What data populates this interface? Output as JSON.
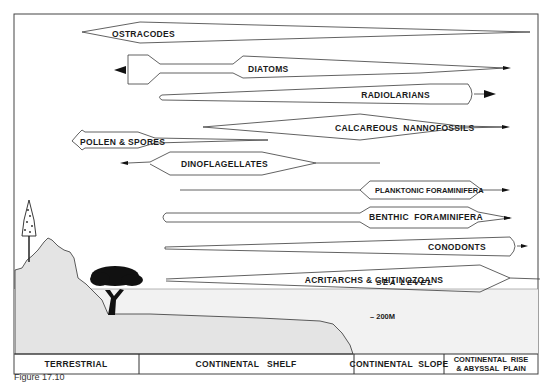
{
  "figure": {
    "caption": "Figure 17.10",
    "sea_level_label": "SEA LEVEL",
    "depth_label": "– 200M",
    "colors": {
      "line": "#3a3a3a",
      "fill_ground": "#e4e4e4",
      "fill_water": "#f2f2f2",
      "tree": "#111111"
    }
  },
  "zones": [
    {
      "label": "TERRESTRIAL"
    },
    {
      "label": "CONTINENTAL   SHELF"
    },
    {
      "label": "CONTINENTAL  SLOPE"
    },
    {
      "label_line1": "CONTINENTAL  RISE",
      "label_line2": "& ABYSSAL  PLAIN"
    }
  ],
  "groups": [
    {
      "name": "OSTRACODES"
    },
    {
      "name": "DIATOMS"
    },
    {
      "name": "RADIOLARIANS"
    },
    {
      "name": "CALCAREOUS  NANNOFOSSILS"
    },
    {
      "name": "POLLEN & SPORES"
    },
    {
      "name": "DINOFLAGELLATES"
    },
    {
      "name": "PLANKTONIC FORAMINIFERA"
    },
    {
      "name": "BENTHIC  FORAMINIFERA"
    },
    {
      "name": "CONODONTS"
    },
    {
      "name": "ACRITARCHS & CHITINOZOANS"
    }
  ]
}
